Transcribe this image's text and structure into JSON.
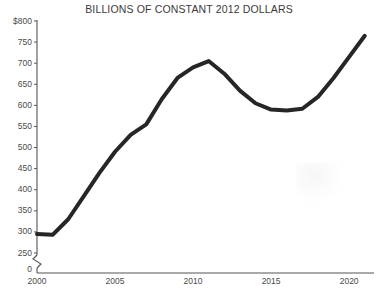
{
  "chart_data": {
    "type": "line",
    "title": "BILLIONS OF CONSTANT 2012 DOLLARS",
    "subtitle": "",
    "xlabel": "",
    "ylabel": "",
    "x": [
      2000,
      2001,
      2002,
      2003,
      2004,
      2005,
      2006,
      2007,
      2008,
      2009,
      2010,
      2011,
      2012,
      2013,
      2014,
      2015,
      2016,
      2017,
      2018,
      2019,
      2020,
      2021
    ],
    "values": [
      295,
      293,
      330,
      385,
      440,
      490,
      530,
      555,
      615,
      665,
      690,
      705,
      675,
      635,
      605,
      590,
      588,
      592,
      620,
      665,
      715,
      765
    ],
    "series": [
      {
        "name": "Defense spending",
        "values": [
          295,
          293,
          330,
          385,
          440,
          490,
          530,
          555,
          615,
          665,
          690,
          705,
          675,
          635,
          605,
          590,
          588,
          592,
          620,
          665,
          715,
          765
        ]
      }
    ],
    "xlim": [
      2000,
      2021.4
    ],
    "ylim": [
      250,
      800
    ],
    "y_axis_break": true,
    "y_break_from": 0,
    "y_break_to": 250,
    "grid": false,
    "legend": "none",
    "line_color": "#262626",
    "line_width": 4,
    "y_ticks": [
      {
        "value": 800,
        "label": "$800"
      },
      {
        "value": 750,
        "label": "750"
      },
      {
        "value": 700,
        "label": "700"
      },
      {
        "value": 650,
        "label": "650"
      },
      {
        "value": 600,
        "label": "600"
      },
      {
        "value": 550,
        "label": "550"
      },
      {
        "value": 500,
        "label": "500"
      },
      {
        "value": 450,
        "label": "450"
      },
      {
        "value": 400,
        "label": "400"
      },
      {
        "value": 350,
        "label": "350"
      },
      {
        "value": 300,
        "label": "300"
      },
      {
        "value": 250,
        "label": "250"
      },
      {
        "value": 0,
        "label": "0"
      }
    ],
    "x_ticks": [
      {
        "value": 2000,
        "label": "2000"
      },
      {
        "value": 2005,
        "label": "2005"
      },
      {
        "value": 2010,
        "label": "2010"
      },
      {
        "value": 2015,
        "label": "2015"
      },
      {
        "value": 2020,
        "label": "2020"
      }
    ],
    "axis_color": "#555555"
  }
}
